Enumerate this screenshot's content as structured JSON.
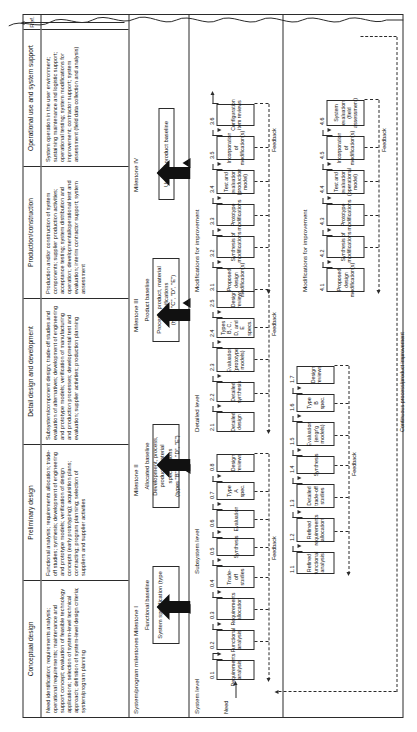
{
  "figure": {
    "ref_column_label": "Ref.",
    "need_label": "Need",
    "continuous_improvement_label": "Continuous process/product improvement",
    "milestone_row_label": "System/program milestones"
  },
  "phases": [
    {
      "id": "conceptual-design",
      "header": "Conceptual design",
      "description": "Need identification; requirements analysis; operational requirements; maintenance and support concept; evaluation of feasible technology applications; selection of system-level technical approach; definition of system-level design criteria; system/program planning"
    },
    {
      "id": "preliminary-design",
      "header": "Preliminary design",
      "description": "Functional analysis; requirements allocation; trade-off studies; synthesis; development of engineering and prototype models; verification of design concepts (early prototyping); acquisition plans; contracting; program planning; selection of suppliers and supplier activities"
    },
    {
      "id": "detail-design-and-development",
      "header": "Detail design and development",
      "description": "Subsystem/component design; trade-off studies and evaluation of alternatives; development of engineering and prototype models; verification of manufacturing and production processes; developmental test and evaluation; supplier activities; production planning"
    },
    {
      "id": "production-construction",
      "header": "Production/construction",
      "description": "Production and/or construction of system components; supplier production activities; acceptance testing; system distribution and operation; developmental/operational test and evaluation; interim contractor support; system assessment"
    },
    {
      "id": "operational-use-and-system-support",
      "header": "Operational use and system support",
      "description": "System operation in the user environment; sustaining maintenance and logistic support; operational testing; system modifications for improvement; contractor support; system assessment (field data collection and analysis)"
    }
  ],
  "milestones": [
    {
      "id": "milestone-1",
      "label": "Milestone I",
      "baseline": "Functional baseline",
      "box_text": "System specification",
      "box_subtext": "(type \"A\")"
    },
    {
      "id": "milestone-2",
      "label": "Milestone II",
      "baseline": "Allocated baseline",
      "box_text": "Development, process, product, material specifications",
      "box_subtext": "(types \"B\", \"C\", \"D\", \"E\")"
    },
    {
      "id": "milestone-3",
      "label": "Milestone III",
      "baseline": "Product baseline",
      "box_text": "Process, product, material specifications",
      "box_subtext": "(types \"C\", \"D\", \"E\")"
    },
    {
      "id": "milestone-4",
      "label": "Milestone IV",
      "baseline": "Updated product baseline",
      "box_text": "",
      "box_subtext": ""
    }
  ],
  "levels": [
    {
      "id": "system-level",
      "title": "System level",
      "feedback_label": "Feedback",
      "steps": [
        {
          "num": "0.1",
          "label": "Requirements analysis"
        },
        {
          "num": "0.2",
          "label": "Functional analysis"
        },
        {
          "num": "0.3",
          "label": "Requirements allocation"
        },
        {
          "num": "0.4",
          "label": "Trade-off studies"
        },
        {
          "num": "0.5",
          "label": "Synthesis"
        },
        {
          "num": "0.6",
          "label": "Evaluation"
        },
        {
          "num": "0.7",
          "label": "Type A spec."
        },
        {
          "num": "0.8",
          "label": "Design reviews"
        }
      ]
    },
    {
      "id": "subsystem-level",
      "title": "Subsystem level",
      "feedback_label": "Feedback",
      "steps": [
        {
          "num": "1.1",
          "label": "Refined functional analysis"
        },
        {
          "num": "1.2",
          "label": "Refined requirements allocation"
        },
        {
          "num": "1.3",
          "label": "Detailed trade-off studies"
        },
        {
          "num": "1.4",
          "label": "Synthesis"
        },
        {
          "num": "1.5",
          "label": "Evaluation (engr'g models)"
        },
        {
          "num": "1.6",
          "label": "Type B spec."
        },
        {
          "num": "1.7",
          "label": "Design reviews"
        }
      ]
    },
    {
      "id": "detailed-level",
      "title": "Detailed level",
      "feedback_label": "Feedback",
      "steps": [
        {
          "num": "2.1",
          "label": "Detailed design"
        },
        {
          "num": "2.2",
          "label": "Detailed synthesis"
        },
        {
          "num": "2.3",
          "label": "Evaluation (prototype models)"
        },
        {
          "num": "2.4",
          "label": "Types B, C, D, and E specs."
        },
        {
          "num": "2.5",
          "label": "Design reviews"
        }
      ]
    },
    {
      "id": "modifications-production",
      "title": "Modifications for improvement",
      "feedback_label": "Feedback",
      "steps": [
        {
          "num": "3.1",
          "label": "Proposed design modification(s)"
        },
        {
          "num": "3.2",
          "label": "Synthesis of modifications"
        },
        {
          "num": "3.3",
          "label": "Prototype modifications"
        },
        {
          "num": "3.4",
          "label": "Test and evaluation (production model)"
        },
        {
          "num": "3.5",
          "label": "Incorporation of modification(s)"
        },
        {
          "num": "3.6",
          "label": "Configuration item reviews"
        }
      ]
    },
    {
      "id": "modifications-operational",
      "title": "Modifications for improvement",
      "feedback_label": "Feedback",
      "steps": [
        {
          "num": "4.1",
          "label": "Proposed design modification(s)"
        },
        {
          "num": "4.2",
          "label": "Synthesis of modifications"
        },
        {
          "num": "4.3",
          "label": "Prototype modifications"
        },
        {
          "num": "4.4",
          "label": "Test and evaluation (operational model)"
        },
        {
          "num": "4.5",
          "label": "Incorporation of modification(s)"
        },
        {
          "num": "4.6",
          "label": "System evaluation (field assessment)"
        }
      ]
    }
  ],
  "colors": {
    "line": "#2b2b2b",
    "text": "#111111",
    "background": "#ffffff"
  }
}
